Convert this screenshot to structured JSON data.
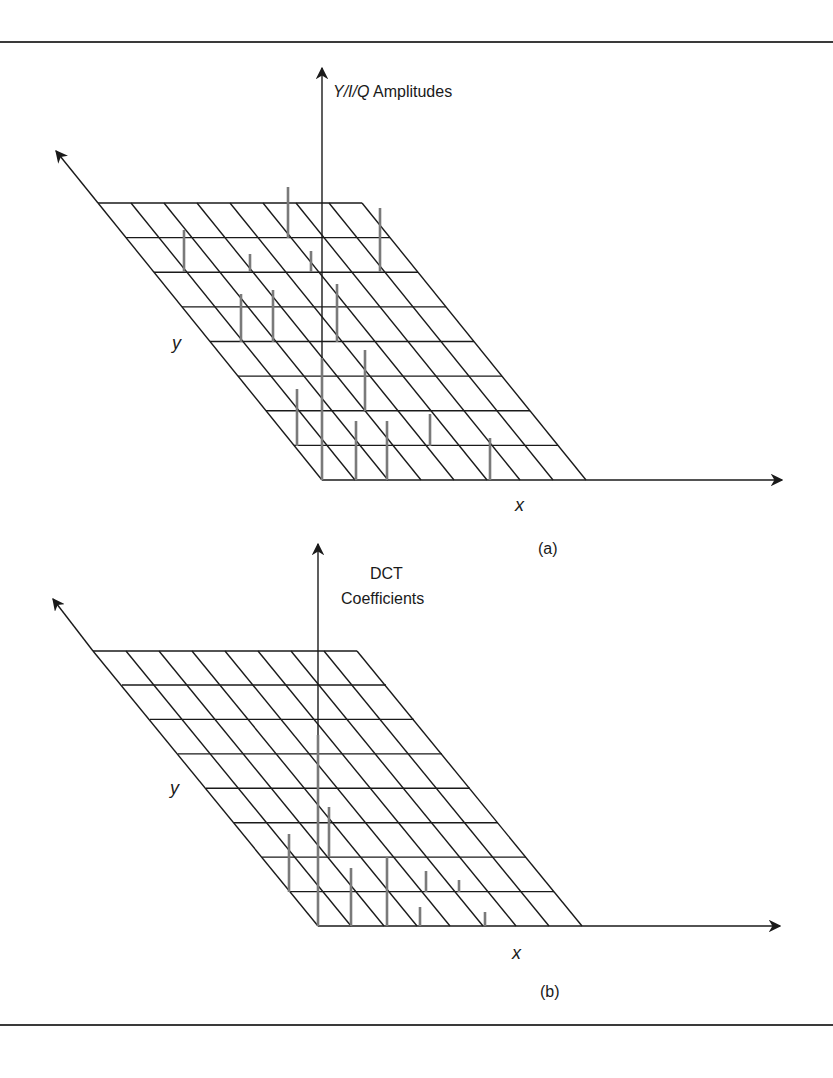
{
  "figure": {
    "panels": [
      {
        "id": "a",
        "caption": "(a)",
        "z_axis_label_italic": "Y/I/Q",
        "z_axis_label_rest": " Amplitudes",
        "x_axis_label": "x",
        "y_axis_label": "y",
        "grid": {
          "rows": 8,
          "cols": 8
        },
        "description": "Spatial-domain sample amplitudes of an 8x8 block drawn as vertical stems on a perspective grid"
      },
      {
        "id": "b",
        "caption": "(b)",
        "z_axis_label_line1": "DCT",
        "z_axis_label_line2": "Coefficients",
        "x_axis_label": "x",
        "y_axis_label": "y",
        "grid": {
          "rows": 8,
          "cols": 8
        },
        "description": "DCT coefficients of the same block, energy concentrated near the origin (low frequencies)"
      }
    ],
    "colors": {
      "line": "#1a1a1a",
      "stem": "#7a7a7a",
      "rule": "#3a3a3a"
    }
  }
}
